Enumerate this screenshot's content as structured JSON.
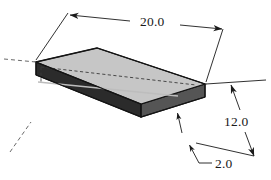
{
  "drawing": {
    "title": "Isometric rectangular block with dimensions",
    "object_name": "rectangular-plate",
    "projection": "isometric",
    "background_color": "#ffffff",
    "line_color": "#1a1a1a",
    "faces": {
      "top_face": {
        "name": "top-face",
        "fill": "#c6c6c6",
        "points": "36,62 97,48 205,84 141,104"
      },
      "front_long_face": {
        "name": "front-left-side-face",
        "fill": "#2b2b2b",
        "points": "36,62 36,75 141,117 141,104"
      },
      "right_end_face": {
        "name": "right-end-face",
        "fill": "#555555",
        "points": "141,104 205,84 205,97 141,117"
      }
    },
    "hidden_lines": [
      {
        "name": "hidden-back-edge",
        "points": "41,67 196,85"
      },
      {
        "name": "hidden-vertical-edge",
        "points": "41,67 41,82"
      }
    ],
    "centerlines": [
      {
        "name": "centerline-left-upper",
        "points": "4,59 36,62"
      },
      {
        "name": "centerline-left-lower",
        "points": "10,152 31,122"
      }
    ],
    "dimensions": [
      {
        "id": "length",
        "name": "dimension-20",
        "value": "20.0",
        "text_x": 140,
        "text_y": 26,
        "describes": "overall length of the plate",
        "arrows": "both-ends",
        "dim_line_left": "69,15 130,21",
        "dim_line_right": "180,25 222,29",
        "ext_line_left": "69,15 36,60",
        "ext_line_right": "222,29 206,82"
      },
      {
        "id": "width",
        "name": "dimension-12",
        "value": "12.0",
        "text_x": 224,
        "text_y": 126,
        "describes": "width (depth) of the plate",
        "arrows": "both-ends",
        "dim_line_upper": "230,86 240,110",
        "dim_line_lower": "243,131 254,155",
        "ext_line_upper": "206,84 265,80",
        "ext_line_lower": "196,143 253,156"
      },
      {
        "id": "thickness",
        "name": "dimension-2",
        "value": "2.0",
        "text_x": 216,
        "text_y": 167,
        "describes": "thickness of the plate",
        "arrows": "single-leader",
        "leader": "211,163 199,163 190,146",
        "arrow_tip": "190,146",
        "inner_arrow": "178,113 182,132"
      }
    ]
  }
}
